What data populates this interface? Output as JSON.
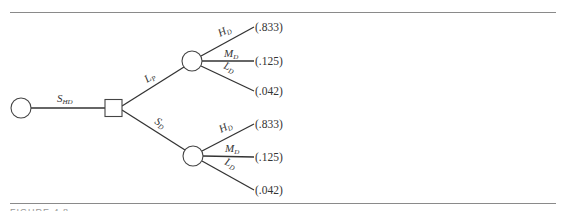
{
  "figure": {
    "caption": "FIGURE 4.8",
    "root": {
      "type": "chance-node"
    },
    "root_branch": {
      "label": "S",
      "sub": "HD"
    },
    "decision": {
      "type": "decision-node"
    },
    "decision_branches": [
      {
        "label": "L",
        "sub": "P",
        "outcomes": [
          {
            "label": "H",
            "sub": "D",
            "prob": "(.833)"
          },
          {
            "label": "M",
            "sub": "D",
            "prob": "(.125)"
          },
          {
            "label": "L",
            "sub": "D",
            "prob": "(.042)"
          }
        ]
      },
      {
        "label": "S",
        "sub": "D",
        "outcomes": [
          {
            "label": "H",
            "sub": "D",
            "prob": "(.833)"
          },
          {
            "label": "M",
            "sub": "D",
            "prob": "(.125)"
          },
          {
            "label": "L",
            "sub": "D",
            "prob": "(.042)"
          }
        ]
      }
    ]
  }
}
